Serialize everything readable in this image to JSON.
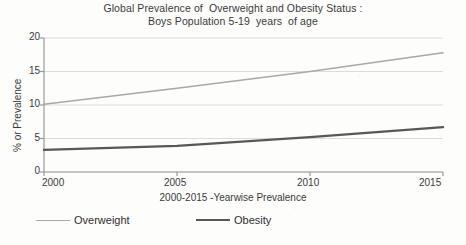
{
  "chart_data": {
    "type": "line",
    "title": "Global Prevalence of  Overweight and Obesity Status :",
    "subtitle": "Boys Population 5-19  years  of age",
    "xlabel": "2000-2015 -Yearwise Prevalence",
    "ylabel": "% or Prevalence",
    "x": [
      2000,
      2005,
      2010,
      2015
    ],
    "xlim": [
      2000,
      2015
    ],
    "ylim": [
      0,
      20
    ],
    "xticks": [
      "2000",
      "2005",
      "2010",
      "2015"
    ],
    "yticks": [
      "0",
      "5",
      "10",
      "15",
      "20"
    ],
    "grid": true,
    "legend_position": "bottom",
    "series": [
      {
        "name": "Overweight",
        "color": "#a8a8a8",
        "width": 1.6,
        "values": [
          10.1,
          12.5,
          15.0,
          17.8
        ]
      },
      {
        "name": "Obesity",
        "color": "#585858",
        "width": 2.4,
        "values": [
          3.3,
          3.9,
          5.2,
          6.7
        ]
      }
    ]
  },
  "axes": {
    "axis_color": "#9b9b9b",
    "grid_color": "#dcdcdc",
    "text_color": "#3a3a3a"
  },
  "legend": {
    "items": [
      {
        "label": "Overweight",
        "color": "#a8a8a8",
        "width": 1.6
      },
      {
        "label": "Obesity",
        "color": "#585858",
        "width": 2.6
      }
    ]
  }
}
